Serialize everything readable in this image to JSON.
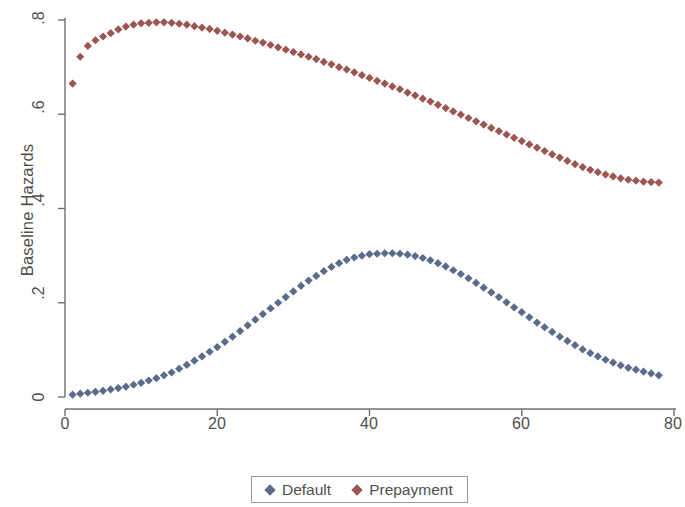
{
  "chart_data": {
    "type": "scatter",
    "title": "",
    "xlabel": "Lifetime from the Onset of Foreclosure (in months)",
    "ylabel": "Baseline Hazards",
    "xlim": [
      0,
      80
    ],
    "ylim": [
      0,
      0.8
    ],
    "xticks": [
      "0",
      "20",
      "40",
      "60",
      "80"
    ],
    "xtick_values": [
      0,
      20,
      40,
      60,
      80
    ],
    "yticks": [
      "0",
      ".2",
      ".4",
      ".6",
      ".8"
    ],
    "ytick_values": [
      0,
      0.2,
      0.4,
      0.6,
      0.8
    ],
    "grid": false,
    "legend_position": "bottom-center",
    "marker": "diamond",
    "series": [
      {
        "name": "Default",
        "color": "#5a6b8c",
        "x": [
          1,
          2,
          3,
          4,
          5,
          6,
          7,
          8,
          9,
          10,
          11,
          12,
          13,
          14,
          15,
          16,
          17,
          18,
          19,
          20,
          21,
          22,
          23,
          24,
          25,
          26,
          27,
          28,
          29,
          30,
          31,
          32,
          33,
          34,
          35,
          36,
          37,
          38,
          39,
          40,
          41,
          42,
          43,
          44,
          45,
          46,
          47,
          48,
          49,
          50,
          51,
          52,
          53,
          54,
          55,
          56,
          57,
          58,
          59,
          60,
          61,
          62,
          63,
          64,
          65,
          66,
          67,
          68,
          69,
          70,
          71,
          72,
          73,
          74,
          75,
          76,
          77,
          78
        ],
        "values": [
          0.005,
          0.007,
          0.009,
          0.011,
          0.013,
          0.016,
          0.019,
          0.022,
          0.026,
          0.03,
          0.035,
          0.04,
          0.046,
          0.052,
          0.06,
          0.068,
          0.077,
          0.086,
          0.096,
          0.106,
          0.117,
          0.128,
          0.14,
          0.152,
          0.164,
          0.176,
          0.188,
          0.2,
          0.212,
          0.224,
          0.236,
          0.247,
          0.257,
          0.267,
          0.276,
          0.284,
          0.291,
          0.296,
          0.3,
          0.303,
          0.304,
          0.305,
          0.305,
          0.304,
          0.302,
          0.299,
          0.295,
          0.29,
          0.284,
          0.277,
          0.269,
          0.261,
          0.252,
          0.242,
          0.232,
          0.222,
          0.212,
          0.201,
          0.19,
          0.18,
          0.169,
          0.158,
          0.148,
          0.138,
          0.128,
          0.119,
          0.11,
          0.101,
          0.093,
          0.086,
          0.079,
          0.073,
          0.067,
          0.062,
          0.058,
          0.054,
          0.05,
          0.046
        ]
      },
      {
        "name": "Prepayment",
        "color": "#9c5550",
        "x": [
          1,
          2,
          3,
          4,
          5,
          6,
          7,
          8,
          9,
          10,
          11,
          12,
          13,
          14,
          15,
          16,
          17,
          18,
          19,
          20,
          21,
          22,
          23,
          24,
          25,
          26,
          27,
          28,
          29,
          30,
          31,
          32,
          33,
          34,
          35,
          36,
          37,
          38,
          39,
          40,
          41,
          42,
          43,
          44,
          45,
          46,
          47,
          48,
          49,
          50,
          51,
          52,
          53,
          54,
          55,
          56,
          57,
          58,
          59,
          60,
          61,
          62,
          63,
          64,
          65,
          66,
          67,
          68,
          69,
          70,
          71,
          72,
          73,
          74,
          75,
          76,
          77,
          78
        ],
        "values": [
          0.665,
          0.722,
          0.745,
          0.757,
          0.765,
          0.772,
          0.78,
          0.786,
          0.79,
          0.793,
          0.794,
          0.795,
          0.795,
          0.794,
          0.792,
          0.79,
          0.787,
          0.784,
          0.781,
          0.777,
          0.773,
          0.769,
          0.765,
          0.761,
          0.756,
          0.752,
          0.747,
          0.742,
          0.737,
          0.732,
          0.727,
          0.722,
          0.717,
          0.711,
          0.706,
          0.7,
          0.695,
          0.689,
          0.683,
          0.677,
          0.671,
          0.665,
          0.659,
          0.653,
          0.646,
          0.64,
          0.633,
          0.627,
          0.62,
          0.613,
          0.606,
          0.599,
          0.592,
          0.585,
          0.578,
          0.571,
          0.564,
          0.557,
          0.55,
          0.543,
          0.536,
          0.529,
          0.522,
          0.515,
          0.508,
          0.501,
          0.494,
          0.488,
          0.482,
          0.477,
          0.472,
          0.468,
          0.464,
          0.461,
          0.459,
          0.457,
          0.456,
          0.455
        ]
      }
    ]
  },
  "legend": {
    "entries": [
      {
        "label": "Default",
        "color": "#5a6b8c"
      },
      {
        "label": "Prepayment",
        "color": "#9c5550"
      }
    ]
  },
  "axes": {
    "y_title": "Baseline Hazards",
    "x_title": "Lifetime from the Onset of Foreclosure (in months)",
    "y_tick_labels": [
      "0",
      ".2",
      ".4",
      ".6",
      ".8"
    ],
    "x_tick_labels": [
      "0",
      "20",
      "40",
      "60",
      "80"
    ]
  }
}
